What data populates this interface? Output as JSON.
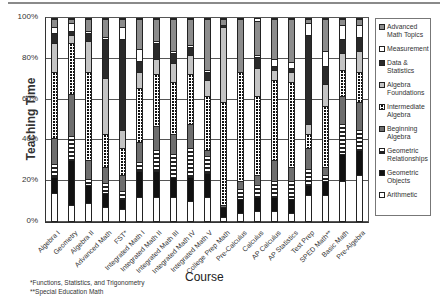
{
  "chart_data": {
    "type": "bar",
    "stacked": true,
    "normalized": true,
    "title": "",
    "xlabel": "Course",
    "ylabel": "Teaching Time",
    "ylim": [
      0,
      100
    ],
    "yticks": [
      "0%",
      "20%",
      "40%",
      "60%",
      "80%",
      "100%"
    ],
    "grid": true,
    "legend_position": "right",
    "categories": [
      "Algebra I",
      "Geometry",
      "Algebra II",
      "Advanced Math",
      "FST*",
      "Integrated Math I",
      "Integrated Math II",
      "Integrated Math III",
      "Integrated Math IV",
      "Integrated Math V",
      "College Prep Math",
      "Pre-Calculus",
      "Calculus",
      "AP Calculus",
      "AP Statistics",
      "Test Prep",
      "SPED Math**",
      "Basic Math",
      "Pre-Algebra"
    ],
    "series": [
      {
        "name": "Arithmetic",
        "key": "arith",
        "values": [
          14,
          8,
          9,
          7,
          6,
          12,
          12,
          12,
          10,
          12,
          2,
          4,
          5,
          5,
          4,
          13,
          13,
          20,
          23
        ]
      },
      {
        "name": "Geometric Objects",
        "key": "geoobj",
        "values": [
          8,
          22,
          9,
          7,
          5,
          13,
          13,
          10,
          12,
          12,
          5,
          7,
          7,
          7,
          7,
          5,
          7,
          13,
          12
        ]
      },
      {
        "name": "Geometric Relationships",
        "key": "georel",
        "values": [
          6,
          12,
          3,
          5,
          4,
          4,
          10,
          11,
          14,
          8,
          0,
          5,
          6,
          8,
          9,
          8,
          3,
          15,
          10
        ]
      },
      {
        "name": "Beginning Algebra",
        "key": "begalg",
        "values": [
          13,
          21,
          9,
          8,
          8,
          10,
          12,
          10,
          12,
          3,
          1,
          4,
          5,
          10,
          7,
          10,
          4,
          14,
          14
        ]
      },
      {
        "name": "Intermediate Algebra",
        "key": "intalg",
        "values": [
          33,
          25,
          44,
          16,
          13,
          27,
          26,
          26,
          25,
          27,
          51,
          54,
          39,
          40,
          42,
          7,
          30,
          13,
          15
        ]
      },
      {
        "name": "Algebra Foundations",
        "key": "algfound",
        "values": [
          14,
          4,
          15,
          28,
          9,
          8,
          7,
          9,
          9,
          8,
          37,
          0,
          14,
          5,
          5,
          5,
          11,
          8,
          10
        ]
      },
      {
        "name": "Data & Statistics",
        "key": "datastat",
        "values": [
          5,
          2,
          4,
          19,
          45,
          5,
          8,
          5,
          4,
          4,
          1,
          0,
          5,
          2,
          2,
          44,
          9,
          7,
          7
        ]
      },
      {
        "name": "Measurement",
        "key": "meas",
        "values": [
          3,
          4,
          1,
          1,
          6,
          6,
          1,
          1,
          1,
          1,
          0,
          0,
          1,
          3,
          3,
          6,
          7,
          7,
          6
        ]
      },
      {
        "name": "Advanced Math Topics",
        "key": "adv",
        "values": [
          4,
          2,
          6,
          9,
          4,
          15,
          11,
          16,
          13,
          25,
          3,
          26,
          17,
          20,
          21,
          2,
          16,
          3,
          3
        ]
      }
    ],
    "footnotes": [
      "*Functions, Statistics, and Trigonometry",
      "**Special Education Math"
    ]
  },
  "labels": {
    "y_axis_title": "Teaching Time",
    "x_axis_title": "Course",
    "footnote_1": "*Functions, Statistics, and Trigonometry",
    "footnote_2": "**Special Education Math"
  },
  "legend": [
    {
      "key": "adv",
      "lines": [
        "Advanced",
        "Math Topics"
      ]
    },
    {
      "key": "meas",
      "lines": [
        "Measurement",
        ""
      ]
    },
    {
      "key": "datastat",
      "lines": [
        "Data &",
        "Statistics"
      ]
    },
    {
      "key": "algfound",
      "lines": [
        "Algebra",
        "Foundations"
      ]
    },
    {
      "key": "intalg",
      "lines": [
        "Intermediate",
        "Algebra"
      ]
    },
    {
      "key": "begalg",
      "lines": [
        "Beginning",
        "Algebra"
      ]
    },
    {
      "key": "georel",
      "lines": [
        "Geometric",
        "Relationships"
      ]
    },
    {
      "key": "geoobj",
      "lines": [
        "Geometric",
        "Objects"
      ]
    },
    {
      "key": "arith",
      "lines": [
        "Arithmetic",
        ""
      ]
    }
  ]
}
